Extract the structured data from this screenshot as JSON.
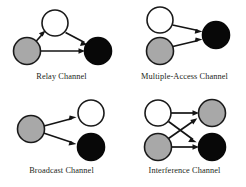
{
  "figure": {
    "background_color": "#ffffff",
    "node_colors": {
      "source": "#a8a8a8",
      "relay": "#ffffff",
      "destination": "#080808"
    },
    "edge_color": "#141414"
  },
  "panels": [
    {
      "id": "relay-channel",
      "caption": "Relay Channel",
      "nodes": [
        {
          "id": "r-source",
          "type": "gray",
          "cx": 27,
          "cy": 51,
          "r": 13.5
        },
        {
          "id": "r-relay",
          "type": "white",
          "cx": 55,
          "cy": 23,
          "r": 13.0
        },
        {
          "id": "r-dest",
          "type": "black",
          "cx": 98,
          "cy": 51,
          "r": 13.5
        }
      ],
      "edges": [
        {
          "from": "r-source",
          "to": "r-relay"
        },
        {
          "from": "r-relay",
          "to": "r-dest"
        },
        {
          "from": "r-source",
          "to": "r-dest"
        }
      ]
    },
    {
      "id": "multiple-access-channel",
      "caption": "Multiple-Access Channel",
      "nodes": [
        {
          "id": "m-user1",
          "type": "white",
          "cx": 160,
          "cy": 20,
          "r": 13.0
        },
        {
          "id": "m-user2",
          "type": "gray",
          "cx": 160,
          "cy": 51,
          "r": 13.5
        },
        {
          "id": "m-dest",
          "type": "black",
          "cx": 216,
          "cy": 35,
          "r": 13.5
        }
      ],
      "edges": [
        {
          "from": "m-user1",
          "to": "m-dest"
        },
        {
          "from": "m-user2",
          "to": "m-dest"
        }
      ]
    },
    {
      "id": "broadcast-channel",
      "caption": "Broadcast Channel",
      "nodes": [
        {
          "id": "b-source",
          "type": "gray",
          "cx": 31,
          "cy": 129,
          "r": 13.5
        },
        {
          "id": "b-dest1",
          "type": "white",
          "cx": 91,
          "cy": 113,
          "r": 13.0
        },
        {
          "id": "b-dest2",
          "type": "black",
          "cx": 91,
          "cy": 147,
          "r": 13.5
        }
      ],
      "edges": [
        {
          "from": "b-source",
          "to": "b-dest1"
        },
        {
          "from": "b-source",
          "to": "b-dest2"
        }
      ]
    },
    {
      "id": "interference-channel",
      "caption": "Interference Channel",
      "nodes": [
        {
          "id": "i-tx1",
          "type": "white",
          "cx": 158,
          "cy": 113,
          "r": 13.0
        },
        {
          "id": "i-tx2",
          "type": "gray",
          "cx": 158,
          "cy": 147,
          "r": 13.5
        },
        {
          "id": "i-rx1",
          "type": "gray",
          "cx": 212,
          "cy": 113,
          "r": 13.5
        },
        {
          "id": "i-rx2",
          "type": "black",
          "cx": 212,
          "cy": 147,
          "r": 13.5
        }
      ],
      "edges": [
        {
          "from": "i-tx1",
          "to": "i-rx1"
        },
        {
          "from": "i-tx1",
          "to": "i-rx2"
        },
        {
          "from": "i-tx2",
          "to": "i-rx1"
        },
        {
          "from": "i-tx2",
          "to": "i-rx2"
        }
      ]
    }
  ]
}
